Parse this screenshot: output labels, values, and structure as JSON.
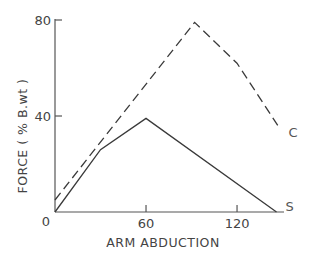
{
  "chart_data": {
    "type": "line",
    "title": "",
    "xlabel": "ARM ABDUCTION",
    "ylabel": "FORCE ( % B.wt )",
    "xlim": [
      0,
      150
    ],
    "ylim": [
      0,
      80
    ],
    "x_ticks": [
      0,
      60,
      120
    ],
    "y_ticks": [
      0,
      40,
      80
    ],
    "x_tick_labels": [
      "0",
      "60",
      "120"
    ],
    "y_tick_labels": [
      "0",
      "40",
      "80"
    ],
    "grid": false,
    "legend": "inline labels at line ends",
    "series": [
      {
        "name": "C",
        "style": "dashed",
        "x": [
          0,
          92,
          120,
          148
        ],
        "y": [
          5,
          79,
          62,
          35
        ]
      },
      {
        "name": "S",
        "style": "solid",
        "x": [
          0,
          30,
          60,
          146
        ],
        "y": [
          0,
          26,
          39,
          0
        ]
      }
    ]
  },
  "axes": {
    "x_title": "ARM ABDUCTION",
    "y_title": "FORCE ( % B.wt )",
    "origin_label": "0"
  },
  "colors": {
    "line": "#3a3a3a",
    "axis": "#555555"
  }
}
